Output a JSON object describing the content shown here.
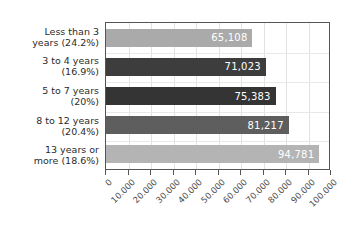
{
  "chart_data": {
    "type": "bar",
    "orientation": "horizontal",
    "title": "",
    "xlabel": "",
    "ylabel": "",
    "categories": [
      "Less than 3\nyears (24.2%)",
      "3 to 4 years\n(16.9%)",
      "5 to 7 years\n(20%)",
      "8 to 12 years\n(20.4%)",
      "13 years or\nmore (18.6%)"
    ],
    "values": [
      65108,
      71023,
      75383,
      81217,
      94781
    ],
    "value_labels": [
      "65,108",
      "71,023",
      "75,383",
      "81,217",
      "94,781"
    ],
    "bar_colors": [
      "#aaaaaa",
      "#3d3d3d",
      "#343434",
      "#5e5e5e",
      "#b4b4b4"
    ],
    "xlim": [
      0,
      100000
    ],
    "xticks": [
      0,
      10000,
      20000,
      30000,
      40000,
      50000,
      60000,
      70000,
      80000,
      90000,
      100000
    ],
    "xtick_labels": [
      "0",
      "10.000",
      "20.000",
      "30.000",
      "40.000",
      "50.000",
      "60.000",
      "70.000",
      "80.000",
      "90.000",
      "100.000"
    ],
    "grid": true,
    "legend": false,
    "plot_border_color": "#555555",
    "gridline_color": "#e2e2e2",
    "value_label_color": "#ffffff",
    "category_label_color": "#2b2b2b",
    "tick_label_color": "#4a4a4a",
    "background_color": "#ffffff"
  }
}
